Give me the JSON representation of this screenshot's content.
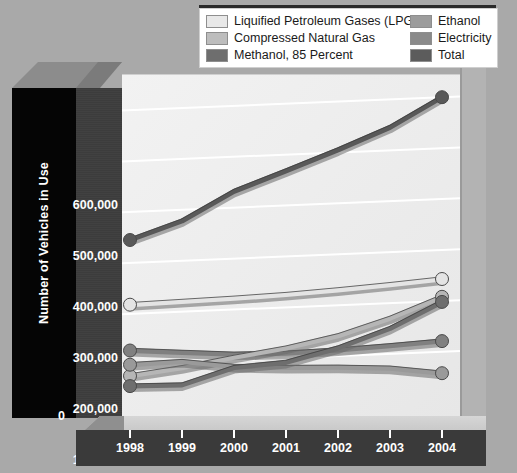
{
  "chart_data": {
    "type": "line",
    "title": "",
    "xlabel": "",
    "ylabel": "Number of Vehicles in Use",
    "x": [
      "1998",
      "1999",
      "2000",
      "2001",
      "2002",
      "2003",
      "2004"
    ],
    "ylim": [
      0,
      650000
    ],
    "yticks": [
      "0",
      "100,000",
      "200,000",
      "300,000",
      "400,000",
      "500,000",
      "600,000"
    ],
    "ytick_values": [
      0,
      100000,
      200000,
      300000,
      400000,
      500000,
      600000
    ],
    "grid": true,
    "legend_position": "top",
    "series": [
      {
        "name": "Liquified Petroleum Gases (LPG)",
        "color": "#e4e4e4",
        "values": [
          218000,
          220000,
          222000,
          225000,
          230000,
          236000,
          243000
        ]
      },
      {
        "name": "Compressed Natural Gas",
        "color": "#b6b6b6",
        "values": [
          78000,
          90000,
          106000,
          120000,
          140000,
          170000,
          208000
        ]
      },
      {
        "name": "Methanol, 85 Percent",
        "color": "#6e6e6e",
        "values": [
          58000,
          56000,
          86000,
          92000,
          116000,
          150000,
          198000
        ]
      },
      {
        "name": "Ethanol",
        "color": "#9a9a9a",
        "values": [
          100000,
          102000,
          88000,
          82000,
          78000,
          72000,
          58000
        ]
      },
      {
        "name": "Electricity",
        "color": "#808080",
        "values": [
          128000,
          120000,
          112000,
          110000,
          112000,
          116000,
          121000
        ]
      },
      {
        "name": "Total",
        "color": "#595959",
        "values": [
          345000,
          378000,
          432000,
          468000,
          505000,
          545000,
          600000
        ]
      }
    ]
  },
  "legend": {
    "items_left": [
      {
        "label": "Liquified Petroleum Gases (LPG)",
        "color": "#e8e8e8"
      },
      {
        "label": "Compressed Natural Gas",
        "color": "#bdbdbd"
      },
      {
        "label": "Methanol, 85 Percent",
        "color": "#6e6e6e"
      }
    ],
    "items_right": [
      {
        "label": "Ethanol",
        "color": "#9c9c9c"
      },
      {
        "label": "Electricity",
        "color": "#8a8a8a"
      },
      {
        "label": "Total",
        "color": "#5c5c5c"
      }
    ]
  },
  "axis": {
    "y_title": "Number of Vehicles in Use",
    "y_zero": "0"
  },
  "colors": {
    "background": "#a9a9a9",
    "plot_background": "#efefef",
    "axis_wall": "#3d3d3d",
    "axis_block": "#050505",
    "gridline": "#ffffff",
    "xband": "#3a3a3a"
  }
}
